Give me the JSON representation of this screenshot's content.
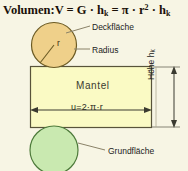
{
  "diagram": {
    "title_parts": {
      "prefix": "Volumen:",
      "body": "V = G · h",
      "sub1": "k",
      "mid": " = π · r",
      "sup": "2",
      "tail": " · h",
      "sub2": "k"
    },
    "title_plain": "Volumen: V = G · hₖ = π · r² · hₖ",
    "labels": {
      "deckflaeche": "Deckfläche",
      "radius": "Radius",
      "grundflaeche": "Grundfläche",
      "mantel": "Mantel",
      "umfang": "u=2·π·r",
      "radius_symbol": "r",
      "hoehe_text": "Höhe h",
      "hoehe_sub": "k"
    },
    "colors": {
      "background": "#f7f5e4",
      "top_circle_fill": "#efd08a",
      "top_circle_stroke": "#6b5a23",
      "bottom_circle_fill": "#c9e9b0",
      "bottom_circle_stroke": "#4d7a3a",
      "rect_fill": "#fafac4",
      "rect_stroke": "#58533a",
      "leader_line": "#8a8268",
      "dimension_line": "#3a3a30",
      "text": "#1d1d1d",
      "title_text": "#1a1008"
    },
    "geometry": {
      "top_circle": {
        "cx": 54,
        "cy": 45,
        "r": 23
      },
      "bottom_circle": {
        "cx": 54,
        "cy": 149,
        "r": 24
      },
      "rect": {
        "x": 30,
        "y": 66,
        "w": 122,
        "h": 62
      },
      "height_dim_x": 174,
      "width_dim_y": 110
    }
  }
}
